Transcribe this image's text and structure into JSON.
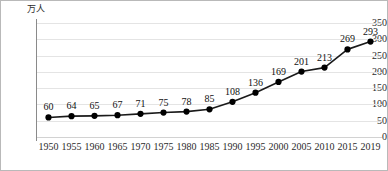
{
  "chart_data": {
    "type": "line",
    "title": "",
    "xlabel": "",
    "ylabel": "万人",
    "y_unit": "万人",
    "categories": [
      "1950",
      "1955",
      "1960",
      "1965",
      "1970",
      "1975",
      "1980",
      "1985",
      "1990",
      "1995",
      "2000",
      "2005",
      "2010",
      "2015",
      "2019"
    ],
    "values": [
      60,
      64,
      65,
      67,
      71,
      75,
      78,
      85,
      108,
      136,
      169,
      201,
      213,
      269,
      293
    ],
    "ylim": [
      0,
      350
    ],
    "ytick_labels": [
      "0",
      "50",
      "100",
      "150",
      "200",
      "250",
      "300",
      "350"
    ],
    "ytick_values": [
      0,
      50,
      100,
      150,
      200,
      250,
      300,
      350
    ],
    "grid": true,
    "legend": "none",
    "data_labels": true,
    "marker": "filled-circle",
    "colors": {
      "line": "#1a1a1a",
      "marker": "#000000",
      "gridline": "#e4e4e4",
      "axis": "#8a8a8a",
      "text": "#2b2b2b",
      "border": "#b9b9b9",
      "background": "#ffffff"
    }
  }
}
